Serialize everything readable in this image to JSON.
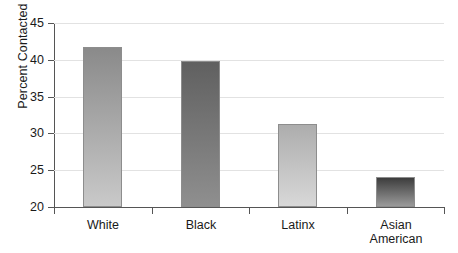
{
  "chart_data": {
    "type": "bar",
    "title": "",
    "xlabel": "",
    "ylabel": "Percent Contacted",
    "categories": [
      "White",
      "Black",
      "Latinx",
      "Asian\nAmerican"
    ],
    "values": [
      41.7,
      39.8,
      31.3,
      24.1
    ],
    "ylim": [
      20,
      45
    ],
    "yticks": [
      20,
      25,
      30,
      35,
      40,
      45
    ],
    "ytick_labels": [
      "20",
      "25",
      "30",
      "35",
      "40",
      "45"
    ],
    "grid": true,
    "legend": "none",
    "bar_colors_top": [
      "#8a8a8a",
      "#606060",
      "#adadad",
      "#3d3d3d"
    ],
    "bar_colors_bottom": [
      "#c9c9c9",
      "#8f8f8f",
      "#d8d8d8",
      "#9a9a9a"
    ],
    "axis_color": "#555555",
    "gridline_color": "#e2e2e2",
    "background_color": "#ffffff"
  }
}
